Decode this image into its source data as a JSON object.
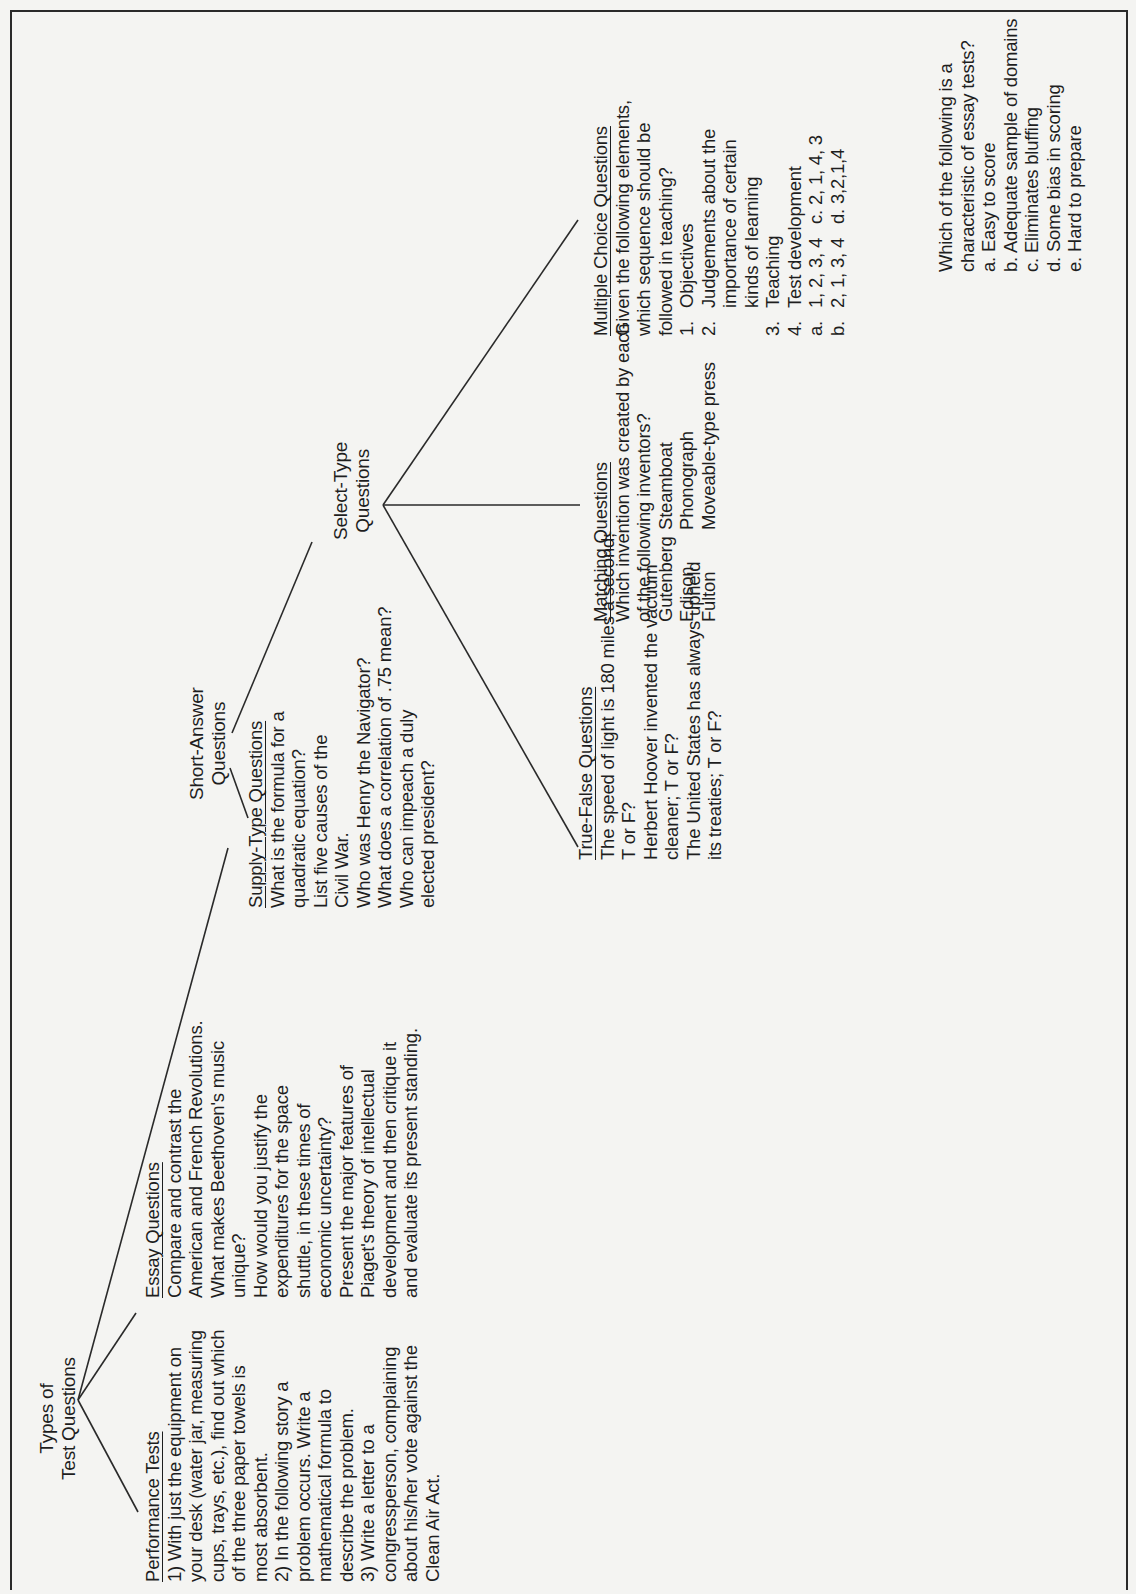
{
  "root": {
    "line1": "Types of",
    "line2": "Test Questions"
  },
  "performance": {
    "heading": "Performance Tests",
    "lines": [
      "1) With just the equipment on",
      "your desk (water jar, measuring",
      "cups, trays, etc.), find out which",
      "of the three paper towels is",
      "most absorbent.",
      "2) In the following story a",
      "problem occurs. Write a",
      "mathematical formula to",
      "describe the problem.",
      "3) Write a letter to a",
      "congressperson, complaining",
      "about his/her vote against the",
      "Clean Air Act."
    ]
  },
  "essay": {
    "heading": "Essay Questions",
    "lines": [
      "Compare and contrast the",
      "American and French Revolutions.",
      "What makes Beethoven's music",
      "unique?",
      "How would you justify the",
      "expenditures for the space",
      "shuttle, in these times of",
      "economic uncertainty?",
      "Present the major features of",
      "Piaget's theory of intellectual",
      "development and then critique it",
      "and evaluate its present standing."
    ]
  },
  "short_answer": {
    "line1": "Short-Answer",
    "line2": "Questions"
  },
  "supply": {
    "heading": "Supply-Type Questions",
    "lines": [
      "What is the formula for a",
      "quadratic equation?",
      "List five causes of the",
      "Civil War.",
      "Who was Henry the Navigator?",
      "What does a correlation of .75 mean?",
      "Who can impeach a duly",
      "elected president?"
    ]
  },
  "select": {
    "line1": "Select-Type",
    "line2": "Questions"
  },
  "true_false": {
    "heading": "True-False Questions",
    "lines": [
      "The speed of light is 180 miles a second;",
      "T or F?",
      "Herbert Hoover invented the vacuum",
      "cleaner; T or F?",
      "The United States has always upheld",
      "its treaties; T or F?"
    ]
  },
  "matching": {
    "heading": "Matching Questions",
    "lines": [
      "Which invention was created by each",
      "of the following inventors?"
    ],
    "pairs": [
      {
        "inventor": "Gutenberg",
        "invention": "Steamboat"
      },
      {
        "inventor": "Edison",
        "invention": "Phonograph"
      },
      {
        "inventor": "Fulton",
        "invention": "Moveable-type press"
      }
    ]
  },
  "multiple_choice": {
    "heading": "Multiple Choice Questions",
    "lines": [
      "Given the following elements,",
      "which sequence should be",
      "followed in teaching?"
    ],
    "items": [
      {
        "num": "1.",
        "text": "Objectives"
      },
      {
        "num": "2.",
        "text": "Judgements about the"
      },
      {
        "num": "",
        "text": "importance of certain"
      },
      {
        "num": "",
        "text": "kinds of learning"
      },
      {
        "num": "3.",
        "text": "Teaching"
      },
      {
        "num": "4.",
        "text": "Test development"
      }
    ],
    "options": [
      {
        "a": "a.",
        "a_text": "1, 2, 3, 4",
        "c": "c. 2, 1, 4, 3"
      },
      {
        "a": "b.",
        "a_text": "2, 1, 3, 4",
        "c": "d. 3,2,1,4"
      }
    ]
  },
  "essay_mc": {
    "lines": [
      "Which of the following is a",
      "characteristic of essay tests?",
      "a. Easy to score",
      "b. Adequate sample of domains",
      "c. Eliminates bluffing",
      "d. Some bias in scoring",
      "e. Hard to prepare"
    ]
  }
}
